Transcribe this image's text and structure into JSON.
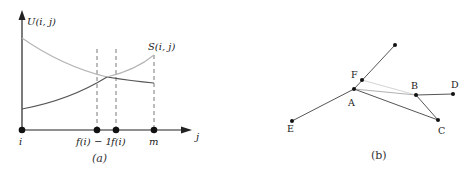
{
  "panel_a": {
    "caption": "(a)",
    "y_axis_label": "U(i, j)",
    "curve_label": "S(i, j)",
    "x_axis_label": "j",
    "x_ticks": [
      {
        "label": "i",
        "x": 22
      },
      {
        "label": "f(i) − 1",
        "x": 97
      },
      {
        "label": "f(i)",
        "x": 116
      },
      {
        "label": "m",
        "x": 154
      }
    ],
    "colors": {
      "axis": "#222222",
      "light_curve": "#b5b5b5",
      "dark_curve": "#555555",
      "dashed": "#555555"
    }
  },
  "panel_b": {
    "caption": "(b)",
    "nodes": [
      {
        "id": "top",
        "label": "",
        "x": 395,
        "y": 45
      },
      {
        "id": "F",
        "label": "F",
        "x": 362,
        "y": 80
      },
      {
        "id": "A",
        "label": "A",
        "x": 354,
        "y": 89
      },
      {
        "id": "B",
        "label": "B",
        "x": 416,
        "y": 95
      },
      {
        "id": "D",
        "label": "D",
        "x": 453,
        "y": 94
      },
      {
        "id": "C",
        "label": "C",
        "x": 438,
        "y": 120
      },
      {
        "id": "E",
        "label": "E",
        "x": 292,
        "y": 121
      }
    ],
    "edges": [
      {
        "from": "A",
        "to": "top",
        "style": "dark"
      },
      {
        "from": "A",
        "to": "E",
        "style": "dark"
      },
      {
        "from": "A",
        "to": "C",
        "style": "dark"
      },
      {
        "from": "B",
        "to": "C",
        "style": "dark"
      },
      {
        "from": "B",
        "to": "D",
        "style": "dark"
      },
      {
        "from": "A",
        "to": "B",
        "style": "light"
      },
      {
        "from": "F",
        "to": "B",
        "style": "lighter"
      }
    ]
  }
}
